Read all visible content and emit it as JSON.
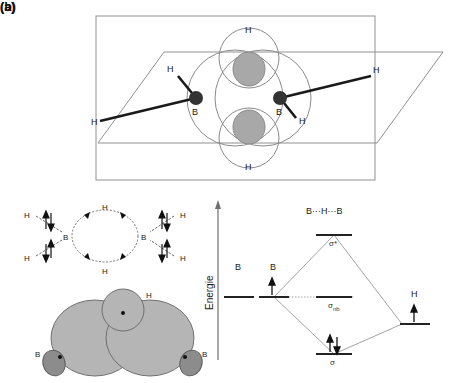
{
  "figure": {
    "panel_a": {
      "label": "(a)",
      "atoms": {
        "boron_left": "B",
        "boron_right": "B",
        "hydrogen_top": "H",
        "hydrogen_bottom": "H",
        "terminal_h_upper_left": "H",
        "terminal_h_lower_left": "H",
        "terminal_h_upper_right": "H",
        "terminal_h_lower_right": "H"
      },
      "description_colors": {
        "plane_stroke": "#808080",
        "orbital_stroke": "#808080",
        "overlap_fill": "#a8a8a8",
        "atom_fill": "#333333",
        "bond_stroke": "#1a1a1a"
      }
    },
    "panel_b": {
      "label": "(b)",
      "electron_scheme": {
        "boron_left": "B",
        "boron_right": "B",
        "bridging_h_top": "H",
        "bridging_h_bottom": "H",
        "terminal_h_upper_left": "H",
        "terminal_h_lower_left": "H",
        "terminal_h_upper_right": "H",
        "terminal_h_lower_right": "H"
      },
      "orbital_overlap": {
        "boron_left": "B",
        "boron_right": "B",
        "hydrogen": "H",
        "lobe_fill": "#b5b5b5",
        "back_lobe_fill": "#8c8c8c"
      },
      "mo_diagram": {
        "axis_label": "Energie",
        "fragment_left_1": "B",
        "fragment_left_2": "B",
        "fragment_right": "H",
        "system_label": "B···H···B",
        "level_antibonding": "σ*",
        "level_nonbonding_base": "σ",
        "level_nonbonding_sub": "nb",
        "level_bonding": "σ",
        "electrons": {
          "boron_level_2": "single up arrow",
          "hydrogen_level": "single up arrow",
          "bonding_level": "up-down electron pair",
          "antibonding_level": "empty",
          "nonbonding_level": "empty"
        }
      }
    }
  }
}
